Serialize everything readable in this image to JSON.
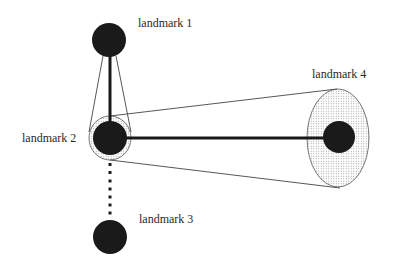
{
  "diagram": {
    "landmarks": [
      {
        "id": 1,
        "label": "landmark 1",
        "cx": 109,
        "cy": 40,
        "r": 17,
        "label_x": 138,
        "label_y": 27
      },
      {
        "id": 2,
        "label": "landmark 2",
        "cx": 110,
        "cy": 138,
        "r": 17,
        "label_x": 22,
        "label_y": 142
      },
      {
        "id": 3,
        "label": "landmark 3",
        "cx": 110,
        "cy": 237,
        "r": 17,
        "label_x": 139,
        "label_y": 223
      },
      {
        "id": 4,
        "label": "landmark 4",
        "cx": 339,
        "cy": 137,
        "r": 16,
        "label_x": 312,
        "label_y": 78
      }
    ],
    "uncertainty_ellipses": [
      {
        "landmark": 2,
        "cx": 110,
        "cy": 138,
        "rx": 21,
        "ry": 22,
        "fill": "dotted"
      },
      {
        "landmark": 4,
        "cx": 338,
        "cy": 138,
        "rx": 31,
        "ry": 49,
        "fill": "dotted"
      }
    ],
    "connections": [
      {
        "from": 1,
        "to": 2,
        "style": "thick-solid"
      },
      {
        "from": 2,
        "to": 4,
        "style": "thick-solid"
      },
      {
        "from": 2,
        "to": 3,
        "style": "dotted"
      }
    ],
    "colors": {
      "landmark_fill": "#1a1a1a",
      "line": "#1a1a1a",
      "thin_line": "#444444",
      "ellipse_stroke": "#555555",
      "dot_fill": "#9a9a9a",
      "background": "#ffffff"
    }
  }
}
